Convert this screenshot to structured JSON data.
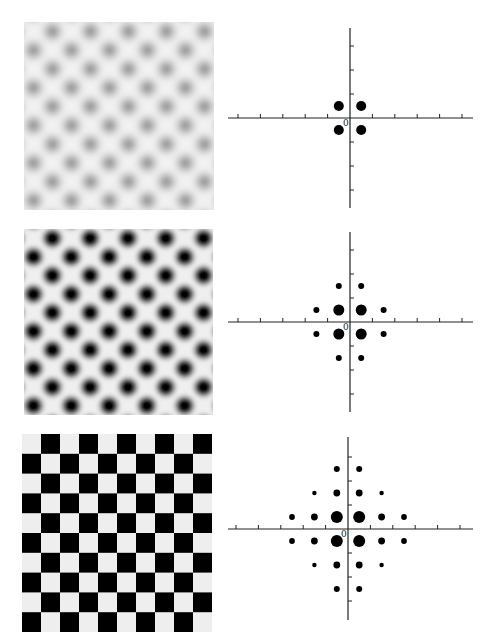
{
  "figure": {
    "colors": {
      "background": "#ffffff",
      "ink": "#000000",
      "axis": "#222222",
      "light_cell": "#ededed"
    }
  },
  "rows": [
    {
      "pattern": {
        "type": "blurred-checkerboard",
        "contrast": "low",
        "cells": 10,
        "x": 24,
        "y": 22,
        "w": 190,
        "h": 188,
        "dark": "#8a8a8a",
        "light": "#f2f2f2",
        "blur": 4.5
      },
      "spectrum": {
        "origin_label": "0",
        "axis_cx": 350,
        "axis_cy": 118,
        "x_from": 228,
        "x_to": 473,
        "y_from": 28,
        "y_to": 208,
        "unit_x": 22.4,
        "unit_y": 24,
        "x_ticks": [
          -5,
          -4,
          -3,
          -2,
          -1,
          1,
          2,
          3,
          4,
          5
        ],
        "y_ticks": [
          -3,
          -2,
          -1,
          1,
          2,
          3
        ],
        "dots": [
          {
            "u": -0.5,
            "v": 0.5,
            "r": 5
          },
          {
            "u": 0.5,
            "v": 0.5,
            "r": 5
          },
          {
            "u": -0.5,
            "v": -0.5,
            "r": 5
          },
          {
            "u": 0.5,
            "v": -0.5,
            "r": 5
          }
        ]
      }
    },
    {
      "pattern": {
        "type": "blurred-checkerboard",
        "contrast": "high",
        "cells": 10,
        "x": 24,
        "y": 229,
        "w": 189,
        "h": 186,
        "dark": "#000000",
        "light": "#efefef",
        "blur": 2.6
      },
      "spectrum": {
        "origin_label": "0",
        "axis_cx": 350,
        "axis_cy": 322,
        "x_from": 228,
        "x_to": 473,
        "y_from": 232,
        "y_to": 412,
        "unit_x": 22.4,
        "unit_y": 24,
        "x_ticks": [
          -5,
          -4,
          -3,
          -2,
          -1,
          1,
          2,
          3,
          4,
          5
        ],
        "y_ticks": [
          -3,
          -2,
          -1,
          1,
          2,
          3
        ],
        "dots": [
          {
            "u": -0.5,
            "v": 0.5,
            "r": 5.5
          },
          {
            "u": 0.5,
            "v": 0.5,
            "r": 5.5
          },
          {
            "u": -0.5,
            "v": -0.5,
            "r": 5.5
          },
          {
            "u": 0.5,
            "v": -0.5,
            "r": 5.5
          },
          {
            "u": -1.5,
            "v": 0.5,
            "r": 3
          },
          {
            "u": 1.5,
            "v": 0.5,
            "r": 3
          },
          {
            "u": -1.5,
            "v": -0.5,
            "r": 3
          },
          {
            "u": 1.5,
            "v": -0.5,
            "r": 3
          },
          {
            "u": -0.5,
            "v": 1.5,
            "r": 3
          },
          {
            "u": 0.5,
            "v": 1.5,
            "r": 3
          },
          {
            "u": -0.5,
            "v": -1.5,
            "r": 3
          },
          {
            "u": 0.5,
            "v": -1.5,
            "r": 3
          }
        ]
      }
    },
    {
      "pattern": {
        "type": "checkerboard",
        "contrast": "sharp",
        "cells": 10,
        "x": 22,
        "y": 434,
        "w": 190,
        "h": 198,
        "dark": "#000000",
        "light": "#eeeeee",
        "blur": 0.4
      },
      "spectrum": {
        "origin_label": "0",
        "axis_cx": 348,
        "axis_cy": 529,
        "x_from": 228,
        "x_to": 473,
        "y_from": 437,
        "y_to": 620,
        "unit_x": 22.4,
        "unit_y": 24,
        "x_ticks": [
          -5,
          -4,
          -3,
          -2,
          -1,
          1,
          2,
          3,
          4,
          5
        ],
        "y_ticks": [
          -3,
          -2,
          -1,
          1,
          2,
          3
        ],
        "dots": [
          {
            "u": -0.5,
            "v": 0.5,
            "r": 6
          },
          {
            "u": 0.5,
            "v": 0.5,
            "r": 6
          },
          {
            "u": -0.5,
            "v": -0.5,
            "r": 6
          },
          {
            "u": 0.5,
            "v": -0.5,
            "r": 6
          },
          {
            "u": -1.5,
            "v": 0.5,
            "r": 3.4
          },
          {
            "u": 1.5,
            "v": 0.5,
            "r": 3.4
          },
          {
            "u": -1.5,
            "v": -0.5,
            "r": 3.4
          },
          {
            "u": 1.5,
            "v": -0.5,
            "r": 3.4
          },
          {
            "u": -2.5,
            "v": 0.5,
            "r": 2.9
          },
          {
            "u": 2.5,
            "v": 0.5,
            "r": 2.9
          },
          {
            "u": -2.5,
            "v": -0.5,
            "r": 2.9
          },
          {
            "u": 2.5,
            "v": -0.5,
            "r": 2.9
          },
          {
            "u": -0.5,
            "v": 1.5,
            "r": 3.4
          },
          {
            "u": 0.5,
            "v": 1.5,
            "r": 3.4
          },
          {
            "u": -0.5,
            "v": -1.5,
            "r": 3.4
          },
          {
            "u": 0.5,
            "v": -1.5,
            "r": 3.4
          },
          {
            "u": -0.5,
            "v": 2.5,
            "r": 3
          },
          {
            "u": 0.5,
            "v": 2.5,
            "r": 3
          },
          {
            "u": -0.5,
            "v": -2.5,
            "r": 3
          },
          {
            "u": 0.5,
            "v": -2.5,
            "r": 3
          },
          {
            "u": -1.5,
            "v": 1.5,
            "r": 2.2
          },
          {
            "u": 1.5,
            "v": 1.5,
            "r": 2.2
          },
          {
            "u": -1.5,
            "v": -1.5,
            "r": 2.2
          },
          {
            "u": 1.5,
            "v": -1.5,
            "r": 2.2
          }
        ]
      }
    }
  ]
}
